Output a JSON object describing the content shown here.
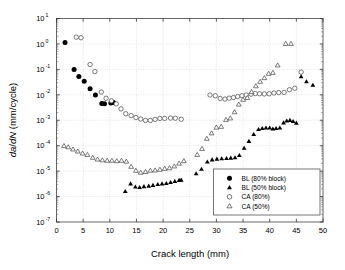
{
  "chart_data": {
    "type": "scatter",
    "title": "",
    "xlabel": "Crack length (mm)",
    "ylabel": "da/dN (mm/cycle)",
    "xlim": [
      0,
      50
    ],
    "ylim": [
      1e-07,
      10
    ],
    "yscale": "log",
    "xscale": "linear",
    "xticks": [
      0,
      5,
      10,
      15,
      20,
      25,
      30,
      35,
      40,
      45,
      50
    ],
    "xtick_labels": [
      "0",
      "5",
      "10",
      "15",
      "20",
      "25",
      "30",
      "35",
      "40",
      "45",
      "50"
    ],
    "yticks": [
      1e-07,
      1e-06,
      1e-05,
      0.0001,
      0.001,
      0.01,
      0.1,
      1,
      10
    ],
    "ytick_labels": [
      "10-7",
      "10-6",
      "10-5",
      "10-4",
      "10-3",
      "10-2",
      "10-1",
      "100",
      "101"
    ],
    "ytick_mantissa": "10",
    "ytick_exponents": [
      "-7",
      "-6",
      "-5",
      "-4",
      "-3",
      "-2",
      "-1",
      "0",
      "1"
    ],
    "grid": true,
    "grid_style": "dotted",
    "grid_color": "#c8c8c8",
    "legend_position": "lower right",
    "series": [
      {
        "name": "BL (80% block)",
        "marker": "filled-circle",
        "color": "#000000",
        "points": [
          [
            1.6,
            1.15
          ],
          [
            3.3,
            0.1
          ],
          [
            4.2,
            0.052
          ],
          [
            5.2,
            0.034
          ],
          [
            6.3,
            0.0175
          ],
          [
            7.3,
            0.0098
          ],
          [
            8.5,
            0.0046
          ],
          [
            9.0,
            0.0045
          ],
          [
            10.2,
            0.0048
          ],
          [
            10.7,
            0.005
          ]
        ]
      },
      {
        "name": "BL (50% block)",
        "marker": "filled-triangle",
        "color": "#000000",
        "points": [
          [
            12.9,
            1.6e-06
          ],
          [
            13.9,
            3.2e-06
          ],
          [
            14.8,
            2.4e-06
          ],
          [
            15.6,
            2.3e-06
          ],
          [
            16.4,
            2.5e-06
          ],
          [
            17.3,
            2.6e-06
          ],
          [
            18.1,
            2.8e-06
          ],
          [
            19.0,
            3e-06
          ],
          [
            19.8,
            3.2e-06
          ],
          [
            20.6,
            3.3e-06
          ],
          [
            21.4,
            3.6e-06
          ],
          [
            22.2,
            4e-06
          ],
          [
            23.0,
            4.4e-06
          ],
          [
            23.4,
            4.5e-06
          ],
          [
            26.2,
            8e-06
          ],
          [
            27.2,
            1.2e-05
          ],
          [
            28.3,
            2.3e-05
          ],
          [
            29.2,
            2.8e-05
          ],
          [
            30.1,
            3e-05
          ],
          [
            31.0,
            3.1e-05
          ],
          [
            31.9,
            3.2e-05
          ],
          [
            32.7,
            3.3e-05
          ],
          [
            33.5,
            3.4e-05
          ],
          [
            34.3,
            4.2e-05
          ],
          [
            35.2,
            8e-05
          ],
          [
            36.1,
            0.00015
          ],
          [
            37.0,
            0.00028
          ],
          [
            37.9,
            0.00044
          ],
          [
            38.6,
            0.00048
          ],
          [
            39.3,
            0.0005
          ],
          [
            40.0,
            0.0005
          ],
          [
            40.6,
            0.00046
          ],
          [
            41.2,
            0.00048
          ],
          [
            41.9,
            0.0005
          ],
          [
            42.6,
            0.0008
          ],
          [
            43.2,
            0.00095
          ],
          [
            43.8,
            0.001
          ],
          [
            44.4,
            0.0009
          ],
          [
            45.0,
            0.00078
          ],
          [
            45.9,
            0.052
          ],
          [
            46.9,
            0.033
          ],
          [
            48.1,
            0.024
          ]
        ]
      },
      {
        "name": "CA (80%)",
        "marker": "open-circle",
        "color": "#000000",
        "points": [
          [
            3.7,
            1.85
          ],
          [
            4.6,
            1.75
          ],
          [
            6.3,
            0.155
          ],
          [
            7.2,
            0.082
          ],
          [
            8.4,
            0.0128
          ],
          [
            9.3,
            0.0073
          ],
          [
            10.3,
            0.0058
          ],
          [
            11.2,
            0.0044
          ],
          [
            12.1,
            0.0028
          ],
          [
            13.0,
            0.0018
          ],
          [
            14.0,
            0.00152
          ],
          [
            14.9,
            0.00128
          ],
          [
            15.8,
            0.00112
          ],
          [
            16.7,
            0.00098
          ],
          [
            17.6,
            0.00098
          ],
          [
            18.5,
            0.00108
          ],
          [
            19.4,
            0.00118
          ],
          [
            20.3,
            0.00118
          ],
          [
            21.4,
            0.00122
          ],
          [
            22.3,
            0.0012
          ],
          [
            23.4,
            0.0011
          ],
          [
            28.8,
            0.0098
          ],
          [
            29.8,
            0.0092
          ],
          [
            30.7,
            0.0072
          ],
          [
            31.6,
            0.0068
          ],
          [
            32.4,
            0.0074
          ],
          [
            33.2,
            0.0078
          ],
          [
            34.0,
            0.0086
          ],
          [
            34.8,
            0.0092
          ],
          [
            35.6,
            0.0098
          ],
          [
            36.5,
            0.0106
          ],
          [
            37.3,
            0.0112
          ],
          [
            38.1,
            0.011
          ],
          [
            39.0,
            0.0108
          ],
          [
            39.9,
            0.011
          ],
          [
            40.8,
            0.0118
          ],
          [
            41.7,
            0.0122
          ],
          [
            42.7,
            0.0124
          ],
          [
            43.7,
            0.0158
          ],
          [
            44.7,
            0.0182
          ],
          [
            45.9,
            0.078
          ]
        ]
      },
      {
        "name": "CA (50%)",
        "marker": "open-triangle",
        "color": "#000000",
        "points": [
          [
            1.4,
            9.8e-05
          ],
          [
            2.2,
            8.8e-05
          ],
          [
            3.1,
            7.2e-05
          ],
          [
            4.0,
            6e-05
          ],
          [
            4.9,
            5e-05
          ],
          [
            5.8,
            4.4e-05
          ],
          [
            6.8,
            3.4e-05
          ],
          [
            7.7,
            2.9e-05
          ],
          [
            8.6,
            2.7e-05
          ],
          [
            9.5,
            2.6e-05
          ],
          [
            10.4,
            2.6e-05
          ],
          [
            11.3,
            2.5e-05
          ],
          [
            12.2,
            2.6e-05
          ],
          [
            13.1,
            2.4e-05
          ],
          [
            14.0,
            1.5e-05
          ],
          [
            14.9,
            1.05e-05
          ],
          [
            15.8,
            8.8e-06
          ],
          [
            16.7,
            9.4e-06
          ],
          [
            17.6,
            1.05e-05
          ],
          [
            18.5,
            1.08e-05
          ],
          [
            19.4,
            1.15e-05
          ],
          [
            20.3,
            1.25e-05
          ],
          [
            21.2,
            1.32e-05
          ],
          [
            22.1,
            1.55e-05
          ],
          [
            23.0,
            2e-05
          ],
          [
            23.9,
            2.5e-05
          ],
          [
            26.4,
            4.4e-05
          ],
          [
            27.3,
            7.6e-05
          ],
          [
            28.2,
            0.00019
          ],
          [
            29.1,
            0.00031
          ],
          [
            30.0,
            0.00052
          ],
          [
            30.9,
            0.00056
          ],
          [
            31.8,
            0.00105
          ],
          [
            32.6,
            0.0012
          ],
          [
            33.4,
            0.0021
          ],
          [
            34.2,
            0.0042
          ],
          [
            35.0,
            0.0065
          ],
          [
            35.8,
            0.0076
          ],
          [
            36.6,
            0.013
          ],
          [
            37.4,
            0.022
          ],
          [
            38.2,
            0.033
          ],
          [
            39.0,
            0.046
          ],
          [
            39.8,
            0.068
          ],
          [
            40.6,
            0.074
          ],
          [
            41.5,
            0.145
          ],
          [
            43.0,
            1.02
          ],
          [
            44.0,
            1.02
          ]
        ]
      }
    ]
  },
  "legend": {
    "entries": [
      {
        "label": "BL (80% block)",
        "marker": "filled-circle"
      },
      {
        "label": "BL (50% block)",
        "marker": "filled-triangle"
      },
      {
        "label": "CA (80%)",
        "marker": "open-circle"
      },
      {
        "label": "CA (50%)",
        "marker": "open-triangle"
      }
    ]
  }
}
